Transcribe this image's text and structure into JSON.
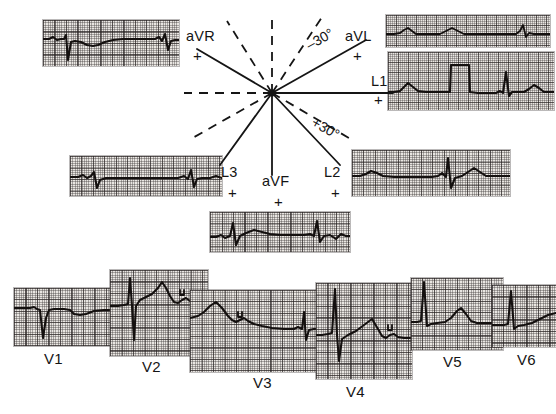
{
  "figure": {
    "type": "ecg-hexaxial-diagram"
  },
  "hexaxial": {
    "center_label": "",
    "limb_leads": [
      {
        "id": "aVR",
        "label": "aVR",
        "polarity": "+",
        "axis_degrees": -150
      },
      {
        "id": "aVL",
        "label": "aVL",
        "polarity": "+",
        "axis_degrees": -30
      },
      {
        "id": "L1",
        "label": "L1",
        "polarity": "+",
        "axis_degrees": 0
      },
      {
        "id": "L2",
        "label": "L2",
        "polarity": "+",
        "axis_degrees": 60
      },
      {
        "id": "aVF",
        "label": "aVF",
        "polarity": "+",
        "axis_degrees": 90
      },
      {
        "id": "L3",
        "label": "L3",
        "polarity": "+",
        "axis_degrees": 120
      }
    ],
    "angle_annotations": [
      {
        "label": "–30°",
        "degrees": -30
      },
      {
        "label": "+30°",
        "degrees": 30
      }
    ]
  },
  "precordial_labels": [
    {
      "id": "V1",
      "label": "V1"
    },
    {
      "id": "V2",
      "label": "V2"
    },
    {
      "id": "V3",
      "label": "V3"
    },
    {
      "id": "V4",
      "label": "V4"
    },
    {
      "id": "V5",
      "label": "V5"
    },
    {
      "id": "V6",
      "label": "V6"
    }
  ],
  "strips": {
    "aVR": {
      "lead": "aVR",
      "beats": 2,
      "dominant_deflection": "negative"
    },
    "aVL": {
      "lead": "aVL",
      "beats": 3,
      "dominant_deflection": "low-amplitude"
    },
    "L1": {
      "lead": "L1",
      "beats": 3,
      "calibration_pulse": true
    },
    "L2": {
      "lead": "L2",
      "beats": 2,
      "dominant_deflection": "positive"
    },
    "L3": {
      "lead": "L3",
      "beats": 3,
      "dominant_deflection": "negative"
    },
    "aVF": {
      "lead": "aVF",
      "beats": 3,
      "dominant_deflection": "positive"
    },
    "V1": {
      "lead": "V1",
      "beats": 1,
      "dominant_deflection": "negative (rS)"
    },
    "V2": {
      "lead": "V2",
      "beats": 1,
      "dominant_deflection": "rS with tall T",
      "u_wave": true
    },
    "V3": {
      "lead": "V3",
      "beats": 1,
      "dominant_deflection": "biphasic",
      "u_wave": true
    },
    "V4": {
      "lead": "V4",
      "beats": 1,
      "dominant_deflection": "RS tall R",
      "u_wave": true
    },
    "V5": {
      "lead": "V5",
      "beats": 1,
      "dominant_deflection": "tall R"
    },
    "V6": {
      "lead": "V6",
      "beats": 1,
      "dominant_deflection": "tall R"
    }
  },
  "colors": {
    "paper": "#e9e6e2",
    "grid_fine": "#5f5757",
    "grid_bold": "#282323",
    "trace": "#14100f",
    "text": "#141414",
    "background": "#ffffff"
  }
}
